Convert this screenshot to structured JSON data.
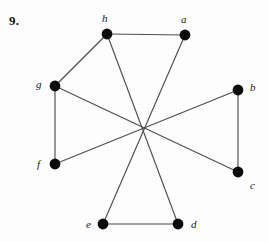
{
  "figure": {
    "problem_number": "9.",
    "width": 269,
    "height": 242,
    "background_color": "#fdfdfd",
    "edge_color": "#4e4e50",
    "vertex_color": "#0b0b0b",
    "label_color": "#17171a"
  },
  "chart_data": {
    "type": "diagram",
    "subtype": "undirected-graph",
    "title": "9.",
    "vertex_count": 8,
    "edge_count": 9,
    "vertices": [
      {
        "id": "a",
        "label": "a",
        "x": 185,
        "y": 35,
        "r": 5.4,
        "label_x": 181,
        "label_y": 14,
        "degree": 2
      },
      {
        "id": "b",
        "label": "b",
        "x": 238,
        "y": 90,
        "r": 5.4,
        "label_x": 250,
        "label_y": 82,
        "degree": 2
      },
      {
        "id": "c",
        "label": "c",
        "x": 238,
        "y": 172,
        "r": 5.4,
        "label_x": 250,
        "label_y": 180,
        "degree": 2
      },
      {
        "id": "d",
        "label": "d",
        "x": 178,
        "y": 224,
        "r": 5.4,
        "label_x": 191,
        "label_y": 219,
        "degree": 2
      },
      {
        "id": "e",
        "label": "e",
        "x": 103,
        "y": 224,
        "r": 5.4,
        "label_x": 86,
        "label_y": 219,
        "degree": 2
      },
      {
        "id": "f",
        "label": "f",
        "x": 55,
        "y": 164,
        "r": 5.4,
        "label_x": 37,
        "label_y": 159,
        "degree": 2
      },
      {
        "id": "g",
        "label": "g",
        "x": 55,
        "y": 86,
        "r": 5.4,
        "label_x": 36,
        "label_y": 79,
        "degree": 3
      },
      {
        "id": "h",
        "label": "h",
        "x": 107,
        "y": 34,
        "r": 5.4,
        "label_x": 102,
        "label_y": 13,
        "degree": 3
      }
    ],
    "edges": [
      {
        "from": "h",
        "to": "a",
        "crosses_center": false
      },
      {
        "from": "h",
        "to": "g",
        "crosses_center": false
      },
      {
        "from": "g",
        "to": "f",
        "crosses_center": false
      },
      {
        "from": "b",
        "to": "c",
        "crosses_center": false
      },
      {
        "from": "e",
        "to": "d",
        "crosses_center": false
      },
      {
        "from": "h",
        "to": "d",
        "crosses_center": true
      },
      {
        "from": "a",
        "to": "e",
        "crosses_center": true
      },
      {
        "from": "g",
        "to": "c",
        "crosses_center": true
      },
      {
        "from": "f",
        "to": "b",
        "crosses_center": true
      }
    ],
    "crossing_point": {
      "x": 143,
      "y": 128,
      "lines_through": 4
    }
  }
}
